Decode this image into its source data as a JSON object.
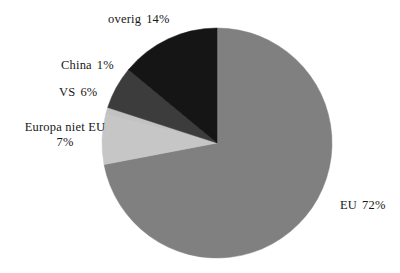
{
  "chart_data": {
    "type": "pie",
    "title": "",
    "subtitle": "",
    "xlabel": "",
    "ylabel": "",
    "legend_position": "none",
    "grid": false,
    "labels_outside": true,
    "start_angle_deg": 0,
    "direction": "clockwise",
    "categories": [
      "EU",
      "overig",
      "VS",
      "China",
      "Europa niet EU"
    ],
    "values": [
      72,
      14,
      6,
      1,
      7
    ],
    "unit": "%",
    "slices": [
      {
        "name": "EU",
        "value": 72,
        "value_label": "72%",
        "color": "#808080",
        "label_id": "label-eu",
        "label_lines": [
          "EU",
          "72%"
        ]
      },
      {
        "name": "overig",
        "value": 14,
        "value_label": "14%",
        "color": "#151515",
        "label_id": "label-overig",
        "label_lines": [
          "overig",
          "14%"
        ]
      },
      {
        "name": "VS",
        "value": 6,
        "value_label": "6%",
        "color": "#3c3c3c",
        "label_id": "label-vs",
        "label_lines": [
          "VS",
          "6%"
        ]
      },
      {
        "name": "China",
        "value": 1,
        "value_label": "1%",
        "color": "#c2c2c2",
        "label_id": "label-china",
        "label_lines": [
          "China",
          "1%"
        ]
      },
      {
        "name": "Europa niet EU",
        "value": 7,
        "value_label": "7%",
        "color": "#c6c6c6",
        "label_id": "label-europa",
        "label_lines": [
          "Europa niet EU",
          "7%"
        ]
      }
    ],
    "geometry": {
      "center_x": 217,
      "center_y": 143,
      "radius": 115
    },
    "colors": {
      "background": "#ffffff",
      "text": "#171717",
      "eu": "#808080",
      "overig": "#151515",
      "vs": "#3c3c3c",
      "china": "#c2c2c2",
      "europa_niet_eu": "#c6c6c6"
    }
  }
}
